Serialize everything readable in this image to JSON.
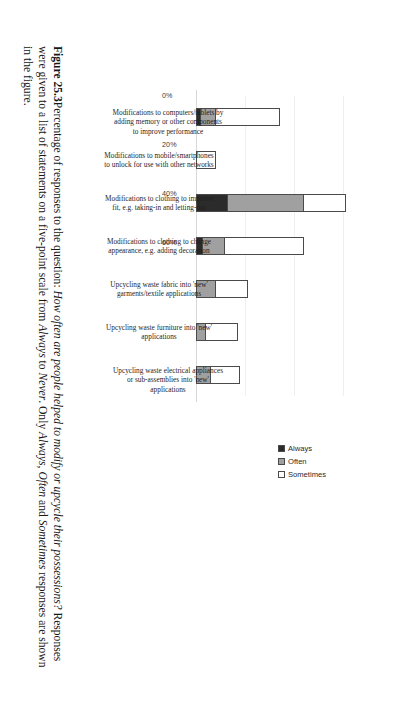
{
  "figure": {
    "number_label": "Figure 25.3",
    "caption_parts": {
      "lead": "Percentage of responses to the question: ",
      "question_italic": "How often are people helped to modify or upcycle their possessions?",
      "mid": " Responses were given to a list of statements on a five-point scale from ",
      "scale_from_italic": "Always",
      "mid2": " to ",
      "scale_to_italic": "Never",
      "mid3": ". Only ",
      "resp1_italic": "Always",
      "sep1": ", ",
      "resp2_italic": "Often",
      "sep2": " and ",
      "resp3_italic": "Sometimes",
      "tail": " responses are shown in the figure."
    }
  },
  "legend": {
    "items": [
      {
        "label": "Always",
        "color": "#2b2b2b",
        "swatch_class": "sw-always"
      },
      {
        "label": "Often",
        "color": "#a0a0a0",
        "swatch_class": "sw-often"
      },
      {
        "label": "Sometimes",
        "color": "#ffffff",
        "swatch_class": "sw-sometimes"
      }
    ]
  },
  "axis": {
    "tick_labels": [
      "0%",
      "20%",
      "40%",
      "60%"
    ],
    "tick_values": [
      0,
      20,
      40,
      60
    ]
  },
  "chart_data": {
    "type": "bar",
    "orientation": "vertical-stacked",
    "title": "",
    "subtitle": "",
    "xlabel": "",
    "ylabel": "",
    "ylim": [
      0,
      70
    ],
    "grid": true,
    "legend_position": "right",
    "categories": [
      "Modifications to computers/tablets by adding memory or other components to improve performance",
      "Modifications to mobile/smartphones to unlock for use with other networks",
      "Modifications to clothing to improve fit, e.g. taking-in and letting-out",
      "Modifications to clothing to change appearance, e.g. adding decoration",
      "Upcycling waste fabric into 'new' garments/textile applications",
      "Upcycling waste furniture into 'new' applications",
      "Upcycling waste electrical appliances or sub-assemblies into 'new' applications"
    ],
    "series": [
      {
        "name": "Always",
        "values": [
          2,
          0,
          13,
          3,
          0,
          0,
          0
        ]
      },
      {
        "name": "Often",
        "values": [
          6,
          0,
          31,
          9,
          8,
          4,
          6
        ]
      },
      {
        "name": "Sometimes",
        "values": [
          26,
          8,
          17,
          32,
          13,
          13,
          12
        ]
      }
    ],
    "totals": [
      34,
      8,
      61,
      44,
      21,
      17,
      18
    ]
  }
}
